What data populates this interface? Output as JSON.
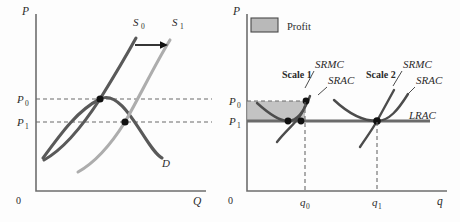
{
  "figure": {
    "panels": [
      {
        "id": "market",
        "name": "market-supply-demand-panel",
        "axis": {
          "y_label": "P",
          "x_label": "Q",
          "origin_label": "0"
        },
        "price_levels": [
          {
            "key": "P0",
            "base": "P",
            "sub": "0",
            "y_value": "P₀"
          },
          {
            "key": "P1",
            "base": "P",
            "sub": "1",
            "y_value": "P₁"
          }
        ],
        "curves": [
          {
            "name": "supply-initial",
            "base": "S",
            "sub": "0",
            "label": "S₀",
            "color": "#595959"
          },
          {
            "name": "supply-shifted",
            "base": "S",
            "sub": "1",
            "label": "S₁",
            "color": "#adadad"
          },
          {
            "name": "demand",
            "base": "D",
            "sub": "",
            "label": "D",
            "color": "#595959"
          }
        ],
        "annotations": [
          {
            "name": "supply-shift-arrow",
            "type": "arrow",
            "direction": "right"
          }
        ],
        "equilibria": [
          {
            "name": "equilibrium-initial",
            "price": "P₀"
          },
          {
            "name": "equilibrium-new",
            "price": "P₁"
          }
        ]
      },
      {
        "id": "firm",
        "name": "firm-cost-curves-panel",
        "axis": {
          "y_label": "P",
          "x_label": "q",
          "origin_label": "0"
        },
        "legend": {
          "name": "profit-legend",
          "label": "Profit",
          "swatch_color": "#b9b9b9",
          "swatch_border": "#4a4a4a"
        },
        "price_levels": [
          {
            "key": "P0",
            "base": "P",
            "sub": "0",
            "y_value": "P₀"
          },
          {
            "key": "P1",
            "base": "P",
            "sub": "1",
            "y_value": "P₁"
          }
        ],
        "quantity_levels": [
          {
            "key": "q0",
            "base": "q",
            "sub": "0",
            "x_value": "q₀"
          },
          {
            "key": "q1",
            "base": "q",
            "sub": "1",
            "x_value": "q₁"
          }
        ],
        "scales": [
          {
            "name": "scale-1",
            "label": "Scale 1",
            "curves": [
              {
                "name": "srmc-scale-1",
                "label": "SRMC"
              },
              {
                "name": "srac-scale-1",
                "label": "SRAC"
              }
            ]
          },
          {
            "name": "scale-2",
            "label": "Scale 2",
            "curves": [
              {
                "name": "srmc-scale-2",
                "label": "SRMC"
              },
              {
                "name": "srac-scale-2",
                "label": "SRAC"
              }
            ]
          }
        ],
        "long_run_curve": {
          "name": "lrac",
          "label": "LRAC"
        },
        "profit_area": {
          "name": "profit-rectangle",
          "fill": "#b9b9b9"
        }
      }
    ]
  }
}
